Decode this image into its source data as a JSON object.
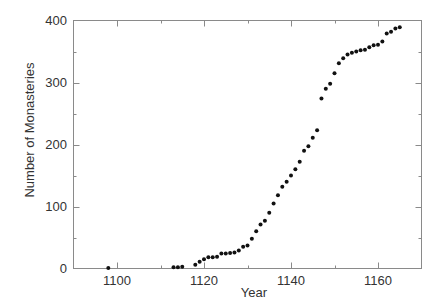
{
  "chart_data": {
    "type": "scatter",
    "title": "",
    "xlabel": "Year",
    "ylabel": "Number of Monasteries",
    "xlim": [
      1090,
      1170
    ],
    "ylim": [
      0,
      400
    ],
    "x_ticks_major": [
      1100,
      1120,
      1140,
      1160
    ],
    "x_tick_labels": [
      "1100",
      "1120",
      "1140",
      "1160"
    ],
    "x_ticks_minor": [
      1090,
      1110,
      1130,
      1150,
      1170
    ],
    "y_ticks_major": [
      0,
      100,
      200,
      300,
      400
    ],
    "y_tick_labels": [
      "0",
      "100",
      "200",
      "300",
      "400"
    ],
    "y_ticks_minor": [
      50,
      150,
      250,
      350
    ],
    "grid": false,
    "legend": null,
    "marker_color": "#111111",
    "frame_color": "#8a8a8a",
    "series": [
      {
        "name": "Monasteries",
        "x": [
          1098,
          1113,
          1114,
          1115,
          1118,
          1119,
          1120,
          1121,
          1122,
          1123,
          1124,
          1125,
          1126,
          1127,
          1128,
          1129,
          1130,
          1131,
          1132,
          1133,
          1134,
          1135,
          1136,
          1137,
          1138,
          1139,
          1140,
          1141,
          1142,
          1143,
          1144,
          1145,
          1146,
          1147,
          1148,
          1149,
          1150,
          1151,
          1152,
          1153,
          1154,
          1155,
          1156,
          1157,
          1158,
          1159,
          1160,
          1161,
          1162,
          1163,
          1164,
          1165
        ],
        "values": [
          1,
          2,
          2,
          3,
          6,
          11,
          15,
          18,
          18,
          19,
          24,
          24,
          25,
          26,
          29,
          35,
          37,
          48,
          60,
          71,
          77,
          90,
          105,
          118,
          132,
          140,
          150,
          160,
          172,
          190,
          197,
          211,
          223,
          274,
          290,
          298,
          315,
          331,
          339,
          345,
          348,
          350,
          352,
          353,
          357,
          360,
          361,
          366,
          379,
          382,
          387,
          389
        ]
      }
    ]
  }
}
